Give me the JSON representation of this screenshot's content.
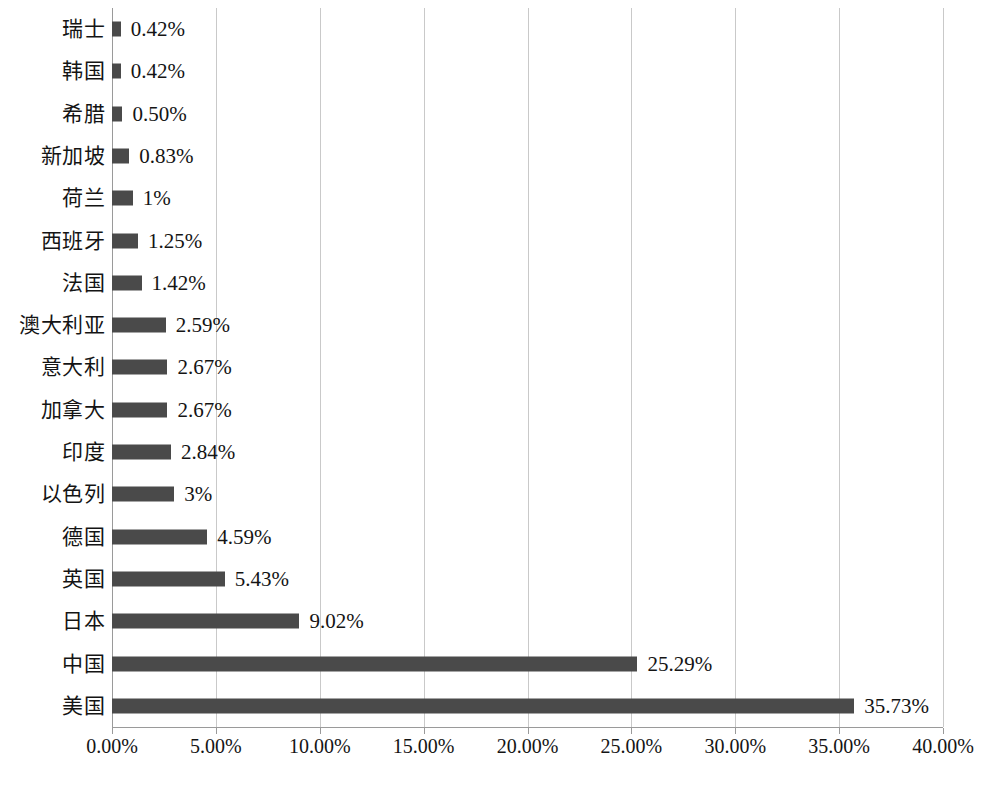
{
  "chart_data": {
    "type": "bar",
    "orientation": "horizontal",
    "title": "",
    "subtitle": "",
    "xlabel": "",
    "ylabel": "",
    "xlim": [
      0,
      40
    ],
    "grid": true,
    "legend": false,
    "bar_color": "#4a4a4a",
    "gridline_color": "#c9c9c9",
    "axis_color": "#9a9a9a",
    "background": "#ffffff",
    "categories": [
      "瑞士",
      "韩国",
      "希腊",
      "新加坡",
      "荷兰",
      "西班牙",
      "法国",
      "澳大利亚",
      "意大利",
      "加拿大",
      "印度",
      "以色列",
      "德国",
      "英国",
      "日本",
      "中国",
      "美国"
    ],
    "values": [
      0.42,
      0.42,
      0.5,
      0.83,
      1,
      1.25,
      1.42,
      2.59,
      2.67,
      2.67,
      2.84,
      3,
      4.59,
      5.43,
      9.02,
      25.29,
      35.73
    ],
    "data_labels": [
      "0.42%",
      "0.42%",
      "0.50%",
      "0.83%",
      "1%",
      "1.25%",
      "1.42%",
      "2.59%",
      "2.67%",
      "2.67%",
      "2.84%",
      "3%",
      "4.59%",
      "5.43%",
      "9.02%",
      "25.29%",
      "35.73%"
    ],
    "xticks": [
      0,
      5,
      10,
      15,
      20,
      25,
      30,
      35,
      40
    ],
    "xtick_labels": [
      "0.00%",
      "5.00%",
      "10.00%",
      "15.00%",
      "20.00%",
      "25.00%",
      "30.00%",
      "35.00%",
      "40.00%"
    ]
  }
}
